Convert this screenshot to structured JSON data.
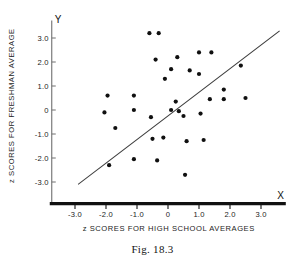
{
  "caption": "Fig. 18.3",
  "chart_data": {
    "type": "scatter",
    "title": "",
    "xlabel": "z SCORES FOR HIGH SCHOOL AVERAGES",
    "ylabel": "z SCORES FOR FRESHMAN AVERAGE",
    "x_axis_name": "X",
    "y_axis_name": "Y",
    "xlim": [
      -3.8,
      3.8
    ],
    "ylim": [
      -3.9,
      3.6
    ],
    "grid": false,
    "legend": null,
    "xticks": [
      -3,
      -2,
      -1,
      0,
      1,
      2,
      3
    ],
    "xtick_labels": [
      "-3.0",
      "-2.0",
      "-1.0",
      "0",
      "1.0",
      "2.0",
      "3.0"
    ],
    "yticks": [
      3,
      2,
      1,
      0,
      -1,
      -2,
      -3
    ],
    "ytick_labels": [
      "3.0",
      "2.0",
      "1.0",
      "0",
      "-1.0",
      "-2.0",
      "-3.0"
    ],
    "points": [
      [
        -0.6,
        3.2
      ],
      [
        -0.3,
        3.2
      ],
      [
        -0.4,
        2.1
      ],
      [
        0.3,
        2.2
      ],
      [
        1.0,
        2.4
      ],
      [
        1.4,
        2.4
      ],
      [
        0.1,
        1.7
      ],
      [
        0.7,
        1.65
      ],
      [
        1.0,
        1.5
      ],
      [
        2.35,
        1.85
      ],
      [
        -0.1,
        1.3
      ],
      [
        1.8,
        0.85
      ],
      [
        -1.95,
        0.6
      ],
      [
        -1.1,
        0.6
      ],
      [
        0.25,
        0.35
      ],
      [
        1.35,
        0.45
      ],
      [
        1.8,
        0.45
      ],
      [
        2.5,
        0.5
      ],
      [
        -1.1,
        0.0
      ],
      [
        0.1,
        0.0
      ],
      [
        0.35,
        -0.05
      ],
      [
        -2.05,
        -0.1
      ],
      [
        1.05,
        -0.15
      ],
      [
        0.5,
        -0.25
      ],
      [
        -0.55,
        -0.3
      ],
      [
        -1.7,
        -0.75
      ],
      [
        -0.5,
        -1.2
      ],
      [
        -0.15,
        -1.15
      ],
      [
        0.6,
        -1.3
      ],
      [
        1.15,
        -1.25
      ],
      [
        -1.1,
        -2.05
      ],
      [
        -0.35,
        -2.1
      ],
      [
        -1.9,
        -2.3
      ],
      [
        0.55,
        -2.7
      ]
    ],
    "fit_line": {
      "x": [
        -2.9,
        3.6
      ],
      "y": [
        -3.1,
        3.3
      ]
    }
  }
}
